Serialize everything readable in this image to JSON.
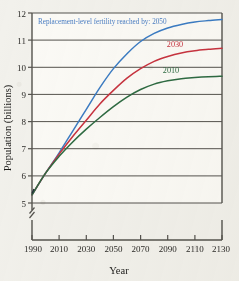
{
  "chart_data": {
    "type": "line",
    "title": "",
    "xlabel": "Year",
    "ylabel": "Population (billions)",
    "xlim": [
      1990,
      2130
    ],
    "ylim": [
      5,
      12
    ],
    "grid": true,
    "axis_break_y": true,
    "legend_position": "inline-annotations",
    "xticks": [
      "1990",
      "2010",
      "2030",
      "2050",
      "2070",
      "2090",
      "2110",
      "2130"
    ],
    "yticks": [
      "5",
      "6",
      "7",
      "8",
      "9",
      "10",
      "11",
      "12"
    ],
    "annotations": [
      {
        "text": "Replacement-level fertility reached by: 2050",
        "color": "#4a7ec4"
      }
    ],
    "x": [
      1990,
      2000,
      2010,
      2020,
      2030,
      2040,
      2050,
      2060,
      2070,
      2080,
      2090,
      2100,
      2110,
      2120,
      2130
    ],
    "series": [
      {
        "name": "2050",
        "label": "Replacement-level fertility reached by: 2050",
        "color": "#3b7cc4",
        "values": [
          5.3,
          6.1,
          6.85,
          7.65,
          8.45,
          9.25,
          9.95,
          10.5,
          10.95,
          11.25,
          11.45,
          11.58,
          11.67,
          11.72,
          11.76
        ]
      },
      {
        "name": "2030",
        "label": "2030",
        "color": "#c8333f",
        "values": [
          5.3,
          6.1,
          6.8,
          7.45,
          8.05,
          8.65,
          9.15,
          9.6,
          9.95,
          10.22,
          10.4,
          10.53,
          10.61,
          10.66,
          10.7
        ]
      },
      {
        "name": "2010",
        "label": "2010",
        "color": "#2e6b42",
        "values": [
          5.3,
          6.1,
          6.72,
          7.25,
          7.72,
          8.15,
          8.55,
          8.9,
          9.18,
          9.38,
          9.5,
          9.58,
          9.62,
          9.65,
          9.67
        ]
      }
    ]
  },
  "labels": {
    "series_2030": "2030",
    "series_2010": "2010",
    "annotation_main": "Replacement-level fertility reached by: 2050",
    "y_axis_title": "Population (billions)",
    "x_axis_title": "Year",
    "y_5": "5",
    "y_6": "6",
    "y_7": "7",
    "y_8": "8",
    "y_9": "9",
    "y_10": "10",
    "y_11": "11",
    "y_12": "12",
    "x_1990": "1990",
    "x_2010": "2010",
    "x_2030": "2030",
    "x_2050": "2050",
    "x_2070": "2070",
    "x_2090": "2090",
    "x_2110": "2110",
    "x_2130": "2130"
  },
  "colors": {
    "blue": "#3b7cc4",
    "red": "#c8333f",
    "green": "#2e6b42",
    "axis": "#55534e",
    "paper": "#f2f1ec"
  }
}
